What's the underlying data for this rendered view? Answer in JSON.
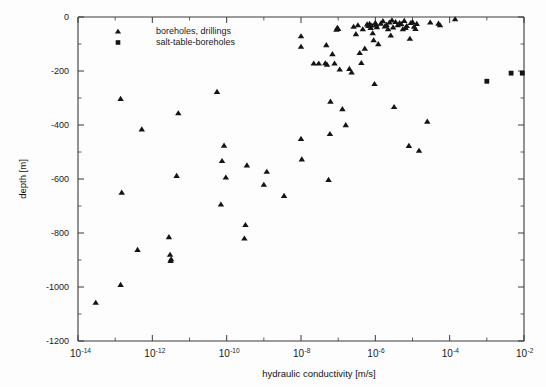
{
  "chart_data": {
    "type": "scatter",
    "title": "",
    "xlabel": "hydraulic conductivity [m/s]",
    "ylabel": "depth [m]",
    "xscale": "log",
    "yscale": "linear",
    "xlim": [
      1e-14,
      0.01
    ],
    "ylim": [
      -1200,
      0
    ],
    "grid": false,
    "legend_position": "top-left",
    "xtick_labels": [
      "10⁻¹⁴",
      "10⁻¹²",
      "10⁻¹⁰",
      "10⁻⁸",
      "10⁻⁶",
      "10⁻⁴",
      "10⁻²"
    ],
    "xtick_exponents": [
      -14,
      -12,
      -10,
      -8,
      -6,
      -4,
      -2
    ],
    "xtick_minor_exponents": [
      -13,
      -11,
      -9,
      -7,
      -5,
      -3
    ],
    "ytick_values": [
      0,
      -200,
      -400,
      -600,
      -800,
      -1000,
      -1200
    ],
    "ytick_labels": [
      "0",
      "-200",
      "-400",
      "-600",
      "-800",
      "-1000",
      "-1200"
    ],
    "ytick_minor_values": [
      -100,
      -300,
      -500,
      -700,
      -900,
      -1100
    ],
    "series": [
      {
        "name": "boreholes, drillings",
        "marker": "triangle",
        "color": "#141414",
        "points": [
          [
            3e-14,
            -1058
          ],
          [
            1.4e-13,
            -992
          ],
          [
            1.5e-13,
            -650
          ],
          [
            1.4e-13,
            -303
          ],
          [
            4e-13,
            -862
          ],
          [
            5.2e-13,
            -416
          ],
          [
            2.8e-12,
            -815
          ],
          [
            3e-12,
            -880
          ],
          [
            3.2e-12,
            -897
          ],
          [
            3.1e-12,
            -903
          ],
          [
            4.5e-12,
            -588
          ],
          [
            5e-12,
            -356
          ],
          [
            5.5e-11,
            -277
          ],
          [
            7e-11,
            -694
          ],
          [
            7.5e-11,
            -533
          ],
          [
            8.5e-11,
            -476
          ],
          [
            9.5e-11,
            -594
          ],
          [
            3e-10,
            -820
          ],
          [
            3.2e-10,
            -770
          ],
          [
            3.5e-10,
            -549
          ],
          [
            1e-09,
            -621
          ],
          [
            1.2e-09,
            -573
          ],
          [
            3.5e-09,
            -662
          ],
          [
            1e-08,
            -71
          ],
          [
            1e-08,
            -110
          ],
          [
            1e-08,
            -451
          ],
          [
            1.05e-08,
            -527
          ],
          [
            2.2e-08,
            -172
          ],
          [
            3e-08,
            -172
          ],
          [
            4.5e-08,
            -171
          ],
          [
            5e-08,
            -176
          ],
          [
            4.8e-08,
            -104
          ],
          [
            5.5e-08,
            -603
          ],
          [
            6e-08,
            -433
          ],
          [
            6.2e-08,
            -313
          ],
          [
            7e-08,
            -137
          ],
          [
            8e-08,
            -172
          ],
          [
            9e-08,
            -47
          ],
          [
            9.5e-08,
            -40
          ],
          [
            1e-07,
            -44
          ],
          [
            1.1e-07,
            -194
          ],
          [
            1.3e-07,
            -341
          ],
          [
            1.6e-07,
            -400
          ],
          [
            2e-07,
            -192
          ],
          [
            2.3e-07,
            -205
          ],
          [
            2.6e-07,
            -36
          ],
          [
            3e-07,
            -63
          ],
          [
            3.4e-07,
            -30
          ],
          [
            3.8e-07,
            -133
          ],
          [
            4.2e-07,
            -170
          ],
          [
            4.6e-07,
            -45
          ],
          [
            5.2e-07,
            -117
          ],
          [
            6e-07,
            -27
          ],
          [
            6.5e-07,
            -33
          ],
          [
            7e-07,
            -25
          ],
          [
            7.5e-07,
            -40
          ],
          [
            8e-07,
            -31
          ],
          [
            8.5e-07,
            -60
          ],
          [
            9e-07,
            -86
          ],
          [
            9.5e-07,
            -248
          ],
          [
            1e-06,
            -22
          ],
          [
            1.05e-06,
            -29
          ],
          [
            1.1e-06,
            -37
          ],
          [
            1.2e-06,
            -100
          ],
          [
            1.4e-06,
            -24
          ],
          [
            1.6e-06,
            -15
          ],
          [
            1.8e-06,
            -35
          ],
          [
            2e-06,
            -29
          ],
          [
            2.2e-06,
            -45
          ],
          [
            2.4e-06,
            -20
          ],
          [
            2.6e-06,
            -68
          ],
          [
            2.8e-06,
            -12
          ],
          [
            3e-06,
            -38
          ],
          [
            3.2e-06,
            -333
          ],
          [
            3.5e-06,
            -18
          ],
          [
            4e-06,
            -30
          ],
          [
            4.5e-06,
            -22
          ],
          [
            5e-06,
            -26
          ],
          [
            5.5e-06,
            -45
          ],
          [
            6e-06,
            -14
          ],
          [
            6.5e-06,
            -40
          ],
          [
            7e-06,
            -33
          ],
          [
            8e-06,
            -477
          ],
          [
            8.5e-06,
            -80
          ],
          [
            9e-06,
            -22
          ],
          [
            1e-05,
            -18
          ],
          [
            1.1e-05,
            -36
          ],
          [
            1.2e-05,
            -44
          ],
          [
            1.3e-05,
            -25
          ],
          [
            1.5e-05,
            -495
          ],
          [
            2.5e-05,
            -387
          ],
          [
            3e-05,
            -20
          ],
          [
            5e-05,
            -24
          ],
          [
            5.5e-05,
            -30
          ],
          [
            0.00014,
            -8
          ]
        ]
      },
      {
        "name": "salt-table-boreholes",
        "marker": "square",
        "color": "#141414",
        "points": [
          [
            0.001,
            -238
          ],
          [
            0.0045,
            -208
          ],
          [
            0.009,
            -208
          ]
        ]
      }
    ]
  },
  "legend": {
    "entries": [
      {
        "label": "boreholes, drillings",
        "marker": "triangle"
      },
      {
        "label": "salt-table-boreholes",
        "marker": "square"
      }
    ]
  },
  "axes": {
    "x_title": "hydraulic conductivity [m/s]",
    "y_title": "depth [m]"
  }
}
